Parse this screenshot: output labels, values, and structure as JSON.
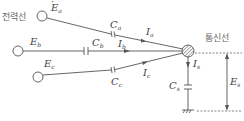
{
  "labels": {
    "power_line": "전력선",
    "comm_line": "통신선"
  },
  "sources": [
    {
      "name": "E",
      "sub": "a"
    },
    {
      "name": "E",
      "sub": "b"
    },
    {
      "name": "E",
      "sub": "c"
    }
  ],
  "capacitors": [
    {
      "name": "C",
      "sub": "a"
    },
    {
      "name": "C",
      "sub": "b"
    },
    {
      "name": "C",
      "sub": "c"
    },
    {
      "name": "C",
      "sub": "s"
    }
  ],
  "currents": [
    {
      "name": "I",
      "sub": "a"
    },
    {
      "name": "I",
      "sub": "b"
    },
    {
      "name": "I",
      "sub": "c"
    },
    {
      "name": "I",
      "sub": "s"
    }
  ],
  "induced_voltage": {
    "name": "E",
    "sub": "s"
  },
  "colors": {
    "line": "#555555",
    "text": "#444444"
  }
}
